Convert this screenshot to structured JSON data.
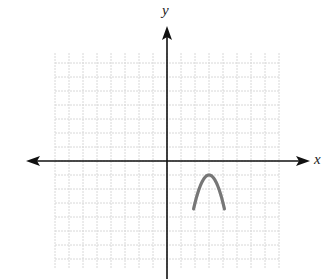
{
  "chart_data": {
    "type": "line",
    "title": "",
    "xlabel": "x",
    "ylabel": "y",
    "xlim": [
      -8,
      8
    ],
    "ylim": [
      -8,
      8
    ],
    "grid": true,
    "series": [
      {
        "name": "parabola",
        "equation": "y = -2(x - 3)^2 - 1",
        "vertex": [
          3,
          -1
        ],
        "opens": "down",
        "x": [
          1,
          1.5,
          2,
          2.5,
          3,
          3.5,
          4,
          4.5,
          5
        ],
        "values": [
          -9,
          -5.5,
          -3,
          -1.5,
          -1,
          -1.5,
          -3,
          -5.5,
          -9
        ]
      }
    ]
  },
  "labels": {
    "x_axis": "x",
    "y_axis": "y"
  },
  "colors": {
    "grid": "#d8d8d8",
    "axis": "#111111",
    "curve": "#777777"
  }
}
